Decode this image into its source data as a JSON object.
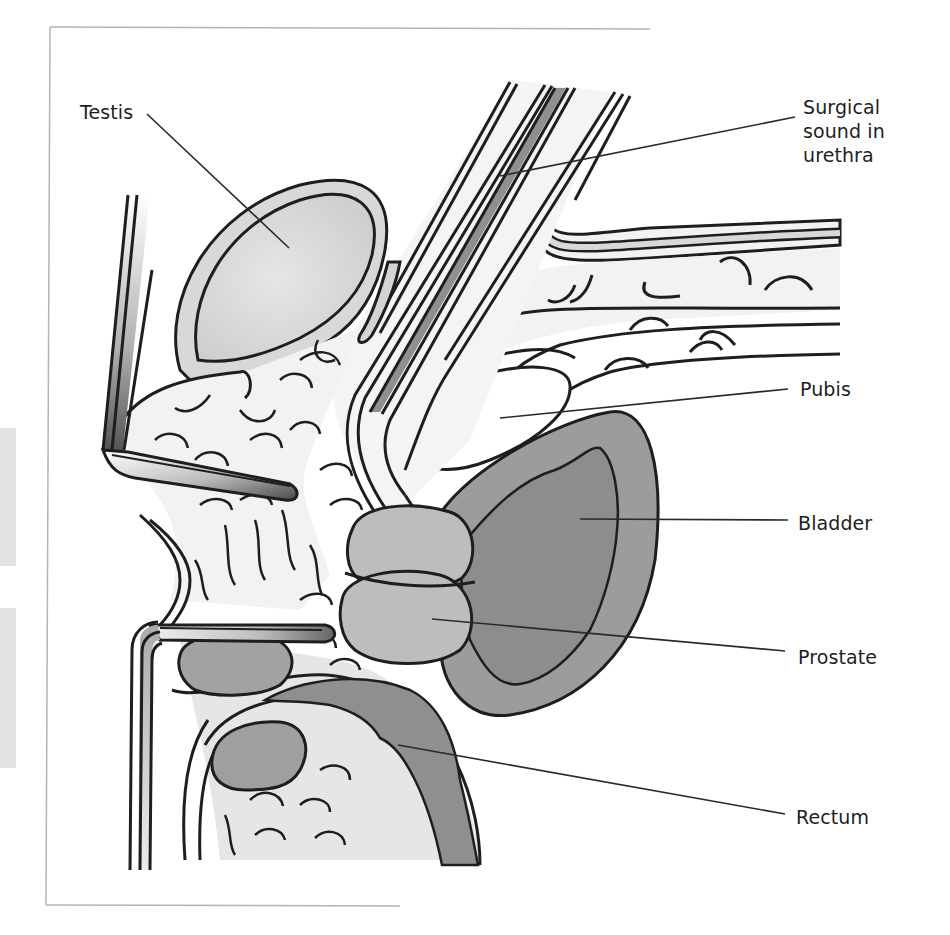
{
  "figure": {
    "palette": {
      "outline": "#1e1e1e",
      "tissue_light": "#f2f2f2",
      "tissue_mid": "#d4d4d4",
      "organ_gray": "#9a9a9a",
      "organ_dark": "#8a8a8a",
      "bone_white": "#ffffff",
      "frame": "#b4b4b4",
      "leader": "#2a2a2a"
    },
    "labels": [
      {
        "id": "testis",
        "text": "Testis"
      },
      {
        "id": "surgical-sound",
        "text": "Surgical\nsound in\nurethra"
      },
      {
        "id": "pubis",
        "text": "Pubis"
      },
      {
        "id": "bladder",
        "text": "Bladder"
      },
      {
        "id": "prostate",
        "text": "Prostate"
      },
      {
        "id": "rectum",
        "text": "Rectum"
      }
    ]
  }
}
